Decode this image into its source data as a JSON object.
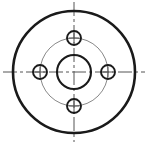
{
  "document": {
    "title": "Flange Plate Technical Drawing",
    "view": "front-view",
    "projection": "orthographic",
    "background_color": "#ffffff",
    "canvas": {
      "width": 147,
      "height": 144
    }
  },
  "drawing": {
    "center": {
      "x": 74,
      "y": 72
    },
    "colors": {
      "outline": "#1a1a1a",
      "bore": "#1a1a1a",
      "hole": "#1a1a1a",
      "pitch_circle": "#888888",
      "centerline": "#555555"
    },
    "outer_circle": {
      "label": "outer-diameter",
      "cx": 74,
      "cy": 72,
      "r": 61,
      "stroke_width": 2.6,
      "stroke": "#1a1a1a",
      "line_type": "continuous-thick"
    },
    "center_bore": {
      "label": "center-bore",
      "cx": 74,
      "cy": 72,
      "r": 17,
      "stroke_width": 2.1,
      "stroke": "#1a1a1a",
      "line_type": "continuous-thick"
    },
    "pitch_circle": {
      "label": "bolt-circle",
      "cx": 74,
      "cy": 72,
      "r": 34,
      "stroke_width": 1.0,
      "stroke": "#888888",
      "line_type": "thin"
    },
    "bolt_holes": {
      "count": 4,
      "r": 7,
      "stroke_width": 1.9,
      "stroke": "#1a1a1a",
      "positions": [
        {
          "name": "hole-top",
          "cx": 74,
          "cy": 38,
          "angle_deg": 90
        },
        {
          "name": "hole-right",
          "cx": 108,
          "cy": 72,
          "angle_deg": 0
        },
        {
          "name": "hole-bottom",
          "cx": 74,
          "cy": 106,
          "angle_deg": 270
        },
        {
          "name": "hole-left",
          "cx": 40,
          "cy": 72,
          "angle_deg": 180
        }
      ]
    },
    "centerlines": {
      "stroke": "#555555",
      "stroke_width": 1.0,
      "dash_pattern": "14 3 3 3",
      "horizontal": {
        "x1": 3,
        "y1": 72,
        "x2": 145,
        "y2": 72
      },
      "vertical": {
        "x1": 74,
        "y1": 2,
        "x2": 74,
        "y2": 142
      },
      "hole_mark_length": 11
    }
  }
}
